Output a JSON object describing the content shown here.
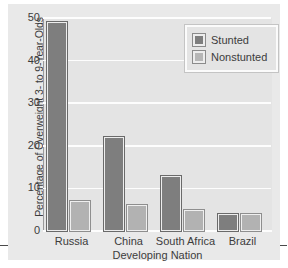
{
  "chart_data": {
    "type": "bar",
    "title": "",
    "xlabel": "Developing Nation",
    "ylabel": "Percentage of Overweight 3- to 9-Year-Olds",
    "categories": [
      "Russia",
      "China",
      "South Africa",
      "Brazil"
    ],
    "series": [
      {
        "name": "Stunted",
        "color": "#7e7e7e",
        "values": [
          49,
          22,
          13,
          4
        ]
      },
      {
        "name": "Nonstunted",
        "color": "#b2b2b2",
        "values": [
          7,
          6,
          5,
          4
        ]
      }
    ],
    "ylim": [
      0,
      50
    ],
    "yticks": [
      0,
      10,
      20,
      30,
      40,
      50
    ],
    "ytick_labels": [
      "0",
      "10",
      "20",
      "30",
      "40",
      "50"
    ],
    "grid": "horizontal",
    "legend_position": "top-right",
    "background_color": "#e4e4e4",
    "gridline_color": "#fdfdfd"
  }
}
